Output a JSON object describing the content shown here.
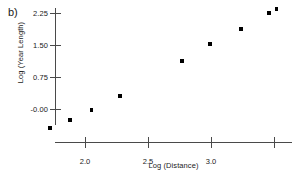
{
  "panel": {
    "label": "b)"
  },
  "chart_data": {
    "type": "scatter",
    "title": "",
    "xlabel": "Log (Distance)",
    "ylabel": "Log (Year Length)",
    "xlim": [
      1.7,
      3.58
    ],
    "ylim": [
      -0.45,
      2.44
    ],
    "grid": false,
    "legend": null,
    "marker": "square",
    "marker_color": "#000000",
    "xticks": [
      2.0,
      2.5,
      3.0,
      3.5
    ],
    "xtick_labels": [
      "2.0",
      "2.5",
      "3.0",
      ""
    ],
    "yticks": [
      2.25,
      1.5,
      0.75,
      -0.0
    ],
    "ytick_labels": [
      "2.25",
      "1.50",
      "0.75",
      "-0.00"
    ],
    "x": [
      1.72,
      1.88,
      2.05,
      2.28,
      2.77,
      2.99,
      3.24,
      3.46,
      3.52
    ],
    "y": [
      -0.45,
      -0.26,
      -0.02,
      0.3,
      1.13,
      1.52,
      1.88,
      2.25,
      2.35
    ],
    "points": [
      {
        "x": 1.72,
        "y": -0.45
      },
      {
        "x": 1.88,
        "y": -0.26
      },
      {
        "x": 2.05,
        "y": -0.02
      },
      {
        "x": 2.28,
        "y": 0.3
      },
      {
        "x": 2.77,
        "y": 1.13
      },
      {
        "x": 2.99,
        "y": 1.52
      },
      {
        "x": 3.24,
        "y": 1.88
      },
      {
        "x": 3.46,
        "y": 2.25
      },
      {
        "x": 3.52,
        "y": 2.35
      }
    ]
  },
  "axes": {
    "x_title": "Log (Distance)",
    "y_title": "Log (Year Length)",
    "x_tick_labels": [
      "2.0",
      "2.5",
      "3.0",
      ""
    ],
    "y_tick_labels": [
      "2.25",
      "1.50",
      "0.75",
      "-0.00"
    ]
  }
}
